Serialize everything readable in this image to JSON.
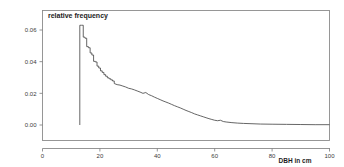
{
  "chart_data": {
    "type": "line",
    "title": "relative frequency",
    "xlabel": "DBH in cm",
    "ylabel": "",
    "xlim": [
      0,
      100
    ],
    "ylim": [
      0.0,
      0.07
    ],
    "xticks": [
      0,
      20,
      40,
      60,
      80,
      100
    ],
    "xtick_labels": [
      "0",
      "20",
      "40",
      "60",
      "80",
      "100"
    ],
    "yticks": [
      0.0,
      0.02,
      0.04,
      0.06
    ],
    "ytick_labels": [
      "0.00",
      "0.02",
      "0.04",
      "0.06"
    ],
    "grid": false,
    "legend": false,
    "curve_color": "#4a4a4a",
    "frame_color": "#8c8c8c",
    "series": [
      {
        "name": "relative frequency",
        "x": [
          13.0,
          13.6,
          14.2,
          14.8,
          15.4,
          16.0,
          16.6,
          17.2,
          17.8,
          18.4,
          19.0,
          19.6,
          20.2,
          20.8,
          21.4,
          22.0,
          22.6,
          23.2,
          23.8,
          24.4,
          25.0,
          26.0,
          27.0,
          28.0,
          29.0,
          30.0,
          31.0,
          32.0,
          33.0,
          34.0,
          35.0,
          36.0,
          37.0,
          38.0,
          39.0,
          40.0,
          41.0,
          42.0,
          43.0,
          44.0,
          45.0,
          46.0,
          47.0,
          48.0,
          49.0,
          50.0,
          51.0,
          52.0,
          53.0,
          54.0,
          55.0,
          56.0,
          57.0,
          58.0,
          59.0,
          60.0,
          61.0,
          62.0,
          63.0,
          64.0,
          66.0,
          68.0,
          70.0,
          73.0,
          76.0,
          80.0,
          85.0,
          90.0,
          95.0,
          100.0
        ],
        "y": [
          0.063,
          0.063,
          0.0555,
          0.0548,
          0.0495,
          0.0488,
          0.0455,
          0.0442,
          0.0402,
          0.0398,
          0.0372,
          0.036,
          0.0342,
          0.0332,
          0.0318,
          0.0308,
          0.0298,
          0.0292,
          0.0285,
          0.0278,
          0.0262,
          0.0255,
          0.0252,
          0.0246,
          0.024,
          0.0232,
          0.0228,
          0.0222,
          0.0215,
          0.0208,
          0.02,
          0.0205,
          0.0192,
          0.0185,
          0.0176,
          0.0168,
          0.016,
          0.0152,
          0.0145,
          0.0138,
          0.013,
          0.0122,
          0.0115,
          0.0108,
          0.01,
          0.0092,
          0.0085,
          0.0078,
          0.007,
          0.0064,
          0.0058,
          0.0052,
          0.0046,
          0.004,
          0.0035,
          0.003,
          0.0027,
          0.003,
          0.0022,
          0.0019,
          0.0015,
          0.0012,
          0.001,
          0.0008,
          0.0006,
          0.0005,
          0.0004,
          0.0003,
          0.0002,
          0.0002
        ]
      }
    ]
  }
}
